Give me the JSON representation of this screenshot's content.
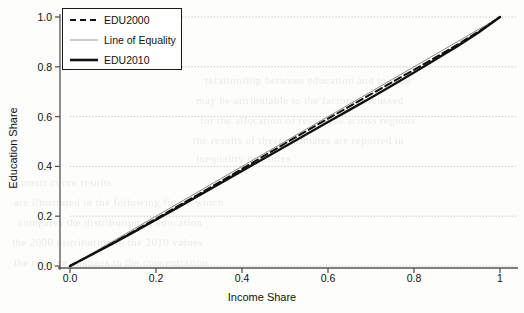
{
  "chart_data": {
    "type": "line",
    "title": "",
    "subtitle": "",
    "xlabel": "Income Share",
    "ylabel": "Education Share",
    "xlim": [
      0,
      1
    ],
    "ylim": [
      0,
      1
    ],
    "xticks": [
      "0.0",
      "0.2",
      "0.4",
      "0.6",
      "0.8",
      "1"
    ],
    "xtick_values": [
      0.0,
      0.2,
      0.4,
      0.6,
      0.8,
      1.0
    ],
    "yticks": [
      "0.0",
      "0.2",
      "0.4",
      "0.6",
      "0.8",
      "1.0"
    ],
    "ytick_values": [
      0.0,
      0.2,
      0.4,
      0.6,
      0.8,
      1.0
    ],
    "grid": "dotted-both",
    "legend_position": "top-left",
    "x": [
      0.0,
      0.05,
      0.1,
      0.15,
      0.2,
      0.25,
      0.3,
      0.35,
      0.4,
      0.45,
      0.5,
      0.55,
      0.6,
      0.65,
      0.7,
      0.75,
      0.8,
      0.85,
      0.9,
      0.95,
      1.0
    ],
    "series": [
      {
        "name": "EDU2000",
        "style": "dashed",
        "color": "#111111",
        "width": 2,
        "values": [
          0.0,
          0.046,
          0.093,
          0.141,
          0.19,
          0.239,
          0.289,
          0.339,
          0.39,
          0.441,
          0.492,
          0.542,
          0.592,
          0.641,
          0.69,
          0.739,
          0.788,
          0.838,
          0.888,
          0.941,
          1.0
        ]
      },
      {
        "name": "Line of Equality",
        "style": "solid-thin",
        "color": "#8a8a8a",
        "width": 1,
        "values": [
          0.0,
          0.05,
          0.1,
          0.15,
          0.2,
          0.25,
          0.3,
          0.35,
          0.4,
          0.45,
          0.5,
          0.55,
          0.6,
          0.65,
          0.7,
          0.75,
          0.8,
          0.85,
          0.9,
          0.95,
          1.0
        ]
      },
      {
        "name": "EDU2010",
        "style": "solid-thick",
        "color": "#111111",
        "width": 2.4,
        "values": [
          0.0,
          0.045,
          0.091,
          0.138,
          0.186,
          0.234,
          0.283,
          0.332,
          0.382,
          0.431,
          0.48,
          0.529,
          0.578,
          0.627,
          0.676,
          0.726,
          0.777,
          0.829,
          0.882,
          0.938,
          1.0
        ]
      }
    ]
  },
  "legend": {
    "entries": [
      {
        "label": "EDU2000"
      },
      {
        "label": "Line of Equality"
      },
      {
        "label": "EDU2010"
      }
    ]
  },
  "ghost_text": {
    "lines": [
      "relationship between education and income",
      "may be attributable to the factors discussed",
      "for the allocation of resources across regions",
      "the results of these estimates are reported in",
      "inequality measures",
      "Lorenz curve results",
      "are illustrated in the following figure which",
      "compares the distribution of education",
      "the 2000 distribution to the 2010 values",
      "the relative changes in the concentration"
    ]
  }
}
